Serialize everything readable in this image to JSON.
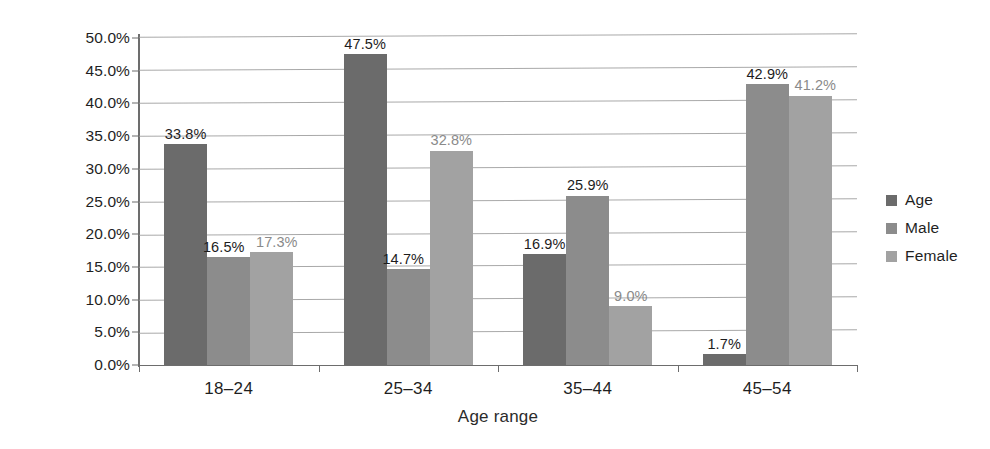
{
  "chart_data": {
    "type": "bar",
    "title": "",
    "subtitle": "",
    "xlabel": "Age range",
    "ylabel": "Percentage",
    "categories": [
      "18–24",
      "25–34",
      "35–44",
      "45–54"
    ],
    "series": [
      {
        "name": "Age",
        "color": "#6b6b6b",
        "values": [
          33.8,
          47.5,
          16.9,
          1.7
        ],
        "labels": [
          "33.8%",
          "47.5%",
          "16.9%",
          "1.7%"
        ]
      },
      {
        "name": "Male",
        "color": "#8c8c8c",
        "values": [
          16.5,
          14.7,
          25.9,
          42.9
        ],
        "labels": [
          "16.5%",
          "14.7%",
          "25.9%",
          "42.9%"
        ]
      },
      {
        "name": "Female",
        "color": "#a2a2a2",
        "values": [
          17.3,
          32.8,
          9.0,
          41.2
        ],
        "labels": [
          "17.3%",
          "32.8%",
          "9.0%",
          "41.2%"
        ]
      }
    ],
    "ylim": [
      0,
      50
    ],
    "ytick_step": 5,
    "ytick_labels": [
      "0.0%",
      "5.0%",
      "10.0%",
      "15.0%",
      "20.0%",
      "25.0%",
      "30.0%",
      "35.0%",
      "40.0%",
      "45.0%",
      "50.0%"
    ],
    "grid": true,
    "grid_axis": "y",
    "legend_position": "right",
    "legend_entries": [
      "Age",
      "Male",
      "Female"
    ],
    "bar_gap_within_group": 0,
    "background_color": "#ffffff",
    "axis_color": "#6d6d6d",
    "grid_color": "#9a9a9a"
  }
}
